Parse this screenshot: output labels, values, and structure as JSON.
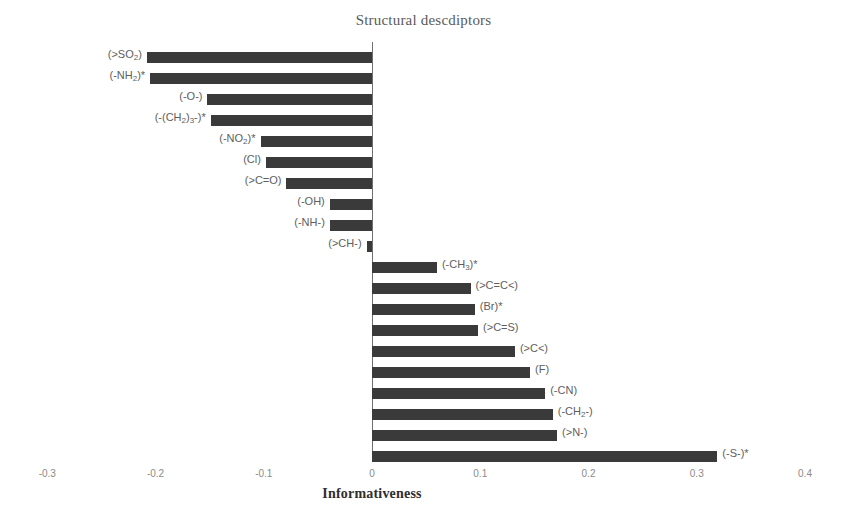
{
  "chart_data": {
    "type": "bar",
    "orientation": "horizontal",
    "title": "Structural descdiptors",
    "xlabel": "Informativeness",
    "ylabel": "",
    "xlim": [
      -0.35,
      0.45
    ],
    "xticks": [
      "-0.3",
      "-0.2",
      "-0.1",
      "0",
      "0.1",
      "0.2",
      "0.3",
      "0.4"
    ],
    "xtick_values": [
      -0.3,
      -0.2,
      -0.1,
      0,
      0.1,
      0.2,
      0.3,
      0.4
    ],
    "grid": false,
    "legend": null,
    "bar_color": "#3a3a3a",
    "axis_color": "#6e6e6e",
    "categories": [
      "(>SO2)",
      "(-NH2)*",
      "(-O-)",
      "(-(CH2)3-)*",
      "(-NO2)*",
      "(Cl)",
      "(>C=O)",
      "(-OH)",
      "(-NH-)",
      "(>CH-)",
      "(-CH3)*",
      "(>C=C<)",
      "(Br)*",
      "(>C=S)",
      "(>C<)",
      "(F)",
      "(-CN)",
      "(-CH2-)",
      "(>N-)",
      "(-S-)*"
    ],
    "values": [
      -0.208,
      -0.205,
      -0.152,
      -0.149,
      -0.103,
      -0.098,
      -0.079,
      -0.039,
      -0.039,
      -0.005,
      0.06,
      0.091,
      0.095,
      0.098,
      0.132,
      0.146,
      0.16,
      0.167,
      0.171,
      0.319
    ],
    "bars": [
      {
        "label_html": "(&gt;SO<sub>2</sub>)",
        "value": -0.208
      },
      {
        "label_html": "(-NH<sub>2</sub>)*",
        "value": -0.205
      },
      {
        "label_html": "(-O-)",
        "value": -0.152
      },
      {
        "label_html": "(-(CH<sub>2</sub>)<sub>3</sub>-)*",
        "value": -0.149
      },
      {
        "label_html": "(-NO<sub>2</sub>)*",
        "value": -0.103
      },
      {
        "label_html": "(Cl)",
        "value": -0.098
      },
      {
        "label_html": "(&gt;C=O)",
        "value": -0.079
      },
      {
        "label_html": "(-OH)",
        "value": -0.039
      },
      {
        "label_html": "(-NH-)",
        "value": -0.039
      },
      {
        "label_html": "(&gt;CH-)",
        "value": -0.005
      },
      {
        "label_html": "(-CH<sub>3</sub>)*",
        "value": 0.06
      },
      {
        "label_html": "(&gt;C=C&lt;)",
        "value": 0.091
      },
      {
        "label_html": "(Br)*",
        "value": 0.095
      },
      {
        "label_html": "(&gt;C=S)",
        "value": 0.098
      },
      {
        "label_html": "(&gt;C&lt;)",
        "value": 0.132
      },
      {
        "label_html": "(F)",
        "value": 0.146
      },
      {
        "label_html": "(-CN)",
        "value": 0.16
      },
      {
        "label_html": "(-CH<sub>2</sub>-)",
        "value": 0.167
      },
      {
        "label_html": "(&gt;N-)",
        "value": 0.171
      },
      {
        "label_html": "(-S-)*",
        "value": 0.319
      }
    ]
  }
}
